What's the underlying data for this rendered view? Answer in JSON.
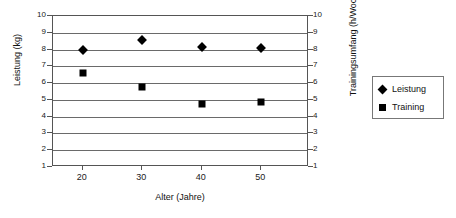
{
  "chart_data": {
    "type": "scatter",
    "title": "",
    "xlabel": "Alter (Jahre)",
    "ylabel": "Leistung (kg)",
    "y2label": "Trainingsumfang (h/Woche)",
    "x": [
      20,
      30,
      40,
      50
    ],
    "xlim": [
      15,
      58
    ],
    "xticks": [
      20,
      30,
      40,
      50
    ],
    "xticklabels": [
      "20",
      "30",
      "40",
      "50"
    ],
    "ylim": [
      1,
      10
    ],
    "yticks": [
      1,
      2,
      3,
      4,
      5,
      6,
      7,
      8,
      9,
      10
    ],
    "yticklabels": [
      "1",
      "2",
      "3",
      "4",
      "5",
      "6",
      "7",
      "8",
      "9",
      "10"
    ],
    "y2lim": [
      1,
      10
    ],
    "y2ticks": [
      1,
      2,
      3,
      4,
      5,
      6,
      7,
      8,
      9,
      10
    ],
    "y2ticklabels": [
      "1",
      "2",
      "3",
      "4",
      "5",
      "6",
      "7",
      "8",
      "9",
      "10"
    ],
    "grid": "horizontal",
    "legend_position": "right-outside",
    "series": [
      {
        "name": "Leistung",
        "marker": "diamond",
        "axis": "left",
        "color": "#000000",
        "values": [
          8.0,
          8.55,
          8.15,
          8.1
        ]
      },
      {
        "name": "Training",
        "marker": "square",
        "axis": "right",
        "color": "#000000",
        "values": [
          6.6,
          5.75,
          4.75,
          4.85
        ]
      }
    ]
  },
  "legend": {
    "items": [
      {
        "label": "Leistung",
        "marker": "diamond"
      },
      {
        "label": "Training",
        "marker": "square"
      }
    ]
  },
  "colors": {
    "marker": "#000000",
    "gridline": "#6a6a6a",
    "frame": "#555555",
    "background": "#ffffff"
  }
}
